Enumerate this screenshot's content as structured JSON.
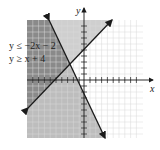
{
  "figure": {
    "inequalities": [
      "y ≤ −2x − 2",
      "y ≥ x + 4"
    ],
    "x_axis_label": "x",
    "y_axis_label": "y",
    "x_range": [
      -10,
      10
    ],
    "y_range": [
      -10,
      10
    ],
    "lines": [
      {
        "equation": "y = -2x - 2",
        "region": "below"
      },
      {
        "equation": "y = x + 4",
        "region": "above"
      }
    ],
    "colors": {
      "overlap": "#8c8c8c",
      "single": "#bdbdbd",
      "lighter": "#d6d6d6",
      "grid": "#cfcfcf",
      "line": "#1a1a1a"
    }
  }
}
